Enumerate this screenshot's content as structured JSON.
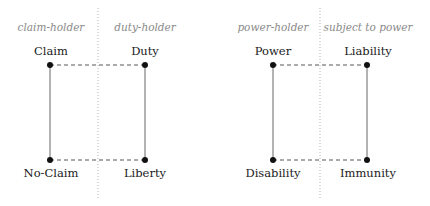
{
  "diagrams": [
    {
      "roles": {
        "left": "claim-holder",
        "right": "duty-holder"
      },
      "corners": {
        "top_left": "Claim",
        "top_right": "Duty",
        "bottom_left": "No-Claim",
        "bottom_right": "Liberty"
      }
    },
    {
      "roles": {
        "left": "power-holder",
        "right": "subject to power"
      },
      "corners": {
        "top_left": "Power",
        "top_right": "Liability",
        "bottom_left": "Disability",
        "bottom_right": "Immunity"
      }
    }
  ],
  "colors": {
    "line": "#555555",
    "dot": "#111111",
    "role_text": "#8a8a8a",
    "divider": "#b0b0b0"
  }
}
